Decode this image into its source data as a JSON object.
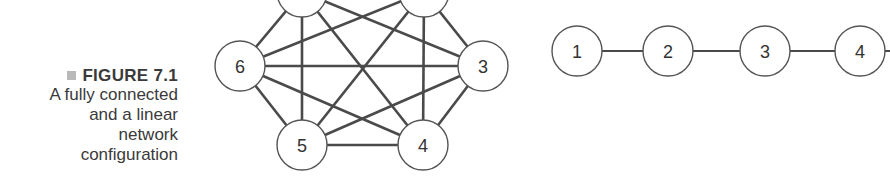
{
  "caption": {
    "figure_label": "FIGURE 7.1",
    "description_lines": [
      "A fully connected",
      "and a linear",
      "network",
      "configuration"
    ]
  },
  "fully_connected": {
    "nodes": [
      {
        "id": "1",
        "label": "1",
        "x": 302,
        "y": -8
      },
      {
        "id": "2",
        "label": "2",
        "x": 424,
        "y": -8
      },
      {
        "id": "3",
        "label": "3",
        "x": 483,
        "y": 66
      },
      {
        "id": "4",
        "label": "4",
        "x": 423,
        "y": 145
      },
      {
        "id": "5",
        "label": "5",
        "x": 302,
        "y": 145
      },
      {
        "id": "6",
        "label": "6",
        "x": 240,
        "y": 66
      }
    ],
    "edges": "all pairs"
  },
  "linear": {
    "nodes": [
      {
        "id": "1",
        "label": "1",
        "x": 577,
        "y": 51
      },
      {
        "id": "2",
        "label": "2",
        "x": 668,
        "y": 51
      },
      {
        "id": "3",
        "label": "3",
        "x": 765,
        "y": 51
      },
      {
        "id": "4",
        "label": "4",
        "x": 860,
        "y": 51
      }
    ],
    "edges": [
      [
        "1",
        "2"
      ],
      [
        "2",
        "3"
      ],
      [
        "3",
        "4"
      ],
      [
        "4",
        "next"
      ]
    ]
  },
  "colors": {
    "line": "#4a4a4a",
    "node_stroke": "#555555",
    "node_fill": "#ffffff",
    "text": "#333333"
  }
}
